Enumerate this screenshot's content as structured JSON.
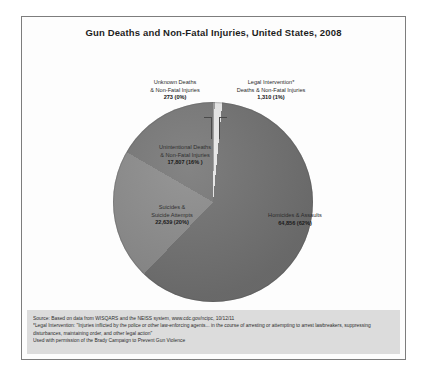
{
  "chart_data": {
    "type": "pie",
    "title": "Gun Deaths and Non-Fatal Injuries, United States, 2008",
    "categories": [
      "Homicides & Assaults",
      "Suicides & Suicide Attempts",
      "Unintentional Deaths & Non-Fatal Injuries",
      "Legal Intervention* Deaths & Non-Fatal Injuries",
      "Unknown Deaths & Non-Fatal Injuries"
    ],
    "values": [
      64856,
      22639,
      17807,
      1310,
      273
    ],
    "percents": [
      62,
      20,
      16,
      1,
      0
    ],
    "value_labels": [
      "64,856 (62%)",
      "22,639 (20%)",
      "17,807 (16% )",
      "1,310 (1%)",
      "273 (0%)"
    ],
    "colors": [
      "#6f6f6f",
      "#8a8a8a",
      "#767676",
      "#e8e8e8",
      "#9c9c9c"
    ],
    "legend": "none",
    "xlabel": "",
    "ylabel": ""
  },
  "chart": {
    "title": "Gun Deaths and Non-Fatal Injuries, United States, 2008",
    "slices": {
      "unknown": {
        "line1": "Unknown Deaths",
        "line2": "& Non-Fatal Injuries",
        "value": "273 (0%)"
      },
      "legal": {
        "line1": "Legal Intervention*",
        "line2": "Deaths & Non-Fatal Injuries",
        "value": "1,310 (1%)"
      },
      "unintentional": {
        "line1": "Unintentional Deaths",
        "line2": "& Non-Fatal Injuries",
        "value": "17,807 (16% )"
      },
      "suicides": {
        "line1": "Suicides &",
        "line2": "Suicide Attempts",
        "value": "22,639 (20%)"
      },
      "homicides": {
        "line1": "Homicides & Assaults",
        "value": "64,856 (62%)"
      }
    }
  },
  "footnote": {
    "source": "Source: Based on data from WISQARS and the NEISS system, www.cdc.gov/ncipc, 10/12/11",
    "definition": "*Legal Intervention: \"Injuries inflicted by the police or other law-enforcing agents... in the course of arresting or attempting to arrest lawbreakers, suppressing disturbances, maintaining order, and other legal action\"",
    "permission": "Used with permission of the Brady Campaign to Prevent Gun Violence"
  }
}
